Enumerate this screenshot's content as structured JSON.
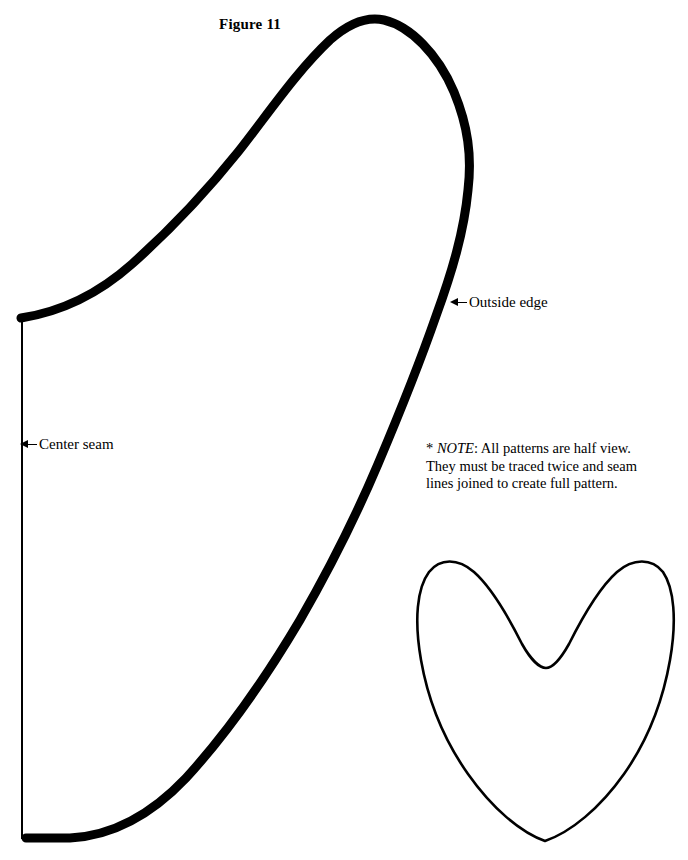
{
  "figure": {
    "label": "Figure 11"
  },
  "callouts": [
    {
      "name": "outside-edge",
      "label": "Outside edge",
      "icon": "arrow-left-icon"
    },
    {
      "name": "center-seam",
      "label": "Center seam",
      "icon": "arrow-left-icon"
    }
  ],
  "note": {
    "marker": "*",
    "emphasis": "NOTE",
    "line1_rest": ": All patterns are half view.",
    "line2": "They must be traced twice and seam",
    "line3": "lines joined to create full pattern."
  },
  "colors": {
    "ink": "#000000",
    "paper": "#ffffff"
  },
  "shapes": {
    "main_pattern_name": "half-pattern-outline",
    "center_seam_name": "center-seam-line",
    "small_pattern_name": "heart-pattern-outline"
  }
}
